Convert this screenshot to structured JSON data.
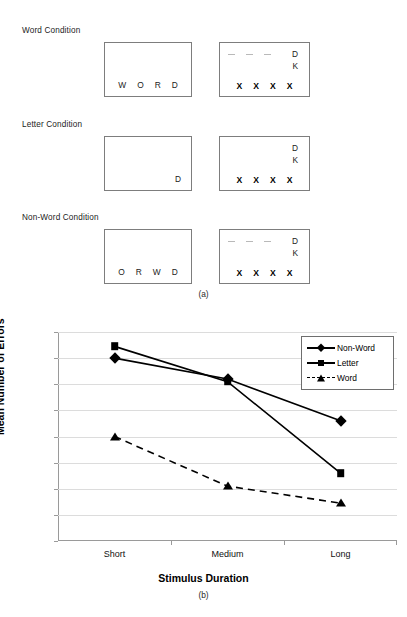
{
  "figure": {
    "panel_a_caption": "(a)",
    "panel_b_caption": "(b)"
  },
  "conditions": [
    {
      "title": "Word Condition",
      "stimulus": [
        "W",
        "O",
        "R",
        "D"
      ],
      "stimulus_align": "center",
      "mask": {
        "dashes": 3,
        "top_letter": "D",
        "second_letter": "K",
        "x_row": [
          "X",
          "X",
          "X",
          "X"
        ]
      }
    },
    {
      "title": "Letter Condition",
      "stimulus": [
        "D"
      ],
      "stimulus_align": "right",
      "mask": {
        "dashes": 0,
        "top_letter": "D",
        "second_letter": "K",
        "x_row": [
          "X",
          "X",
          "X",
          "X"
        ]
      }
    },
    {
      "title": "Non-Word Condition",
      "stimulus": [
        "O",
        "R",
        "W",
        "D"
      ],
      "stimulus_align": "center",
      "mask": {
        "dashes": 3,
        "top_letter": "D",
        "second_letter": "K",
        "x_row": [
          "X",
          "X",
          "X",
          "X"
        ]
      }
    }
  ],
  "chart_data": {
    "type": "line",
    "title": "",
    "xlabel": "Stimulus Duration",
    "ylabel": "Mean Number of Errors",
    "categories": [
      "Short",
      "Medium",
      "Long"
    ],
    "ylim": [
      0,
      16
    ],
    "yticks": [
      0,
      2,
      4,
      6,
      8,
      10,
      12,
      14,
      16
    ],
    "grid": true,
    "legend_position": "top-right",
    "series": [
      {
        "name": "Non-Word",
        "values": [
          14.0,
          12.4,
          9.2
        ],
        "marker": "diamond",
        "line": "solid"
      },
      {
        "name": "Letter",
        "values": [
          14.9,
          12.2,
          5.2
        ],
        "marker": "square",
        "line": "solid"
      },
      {
        "name": "Word",
        "values": [
          8.0,
          4.2,
          2.9
        ],
        "marker": "triangle",
        "line": "dashed"
      }
    ]
  }
}
